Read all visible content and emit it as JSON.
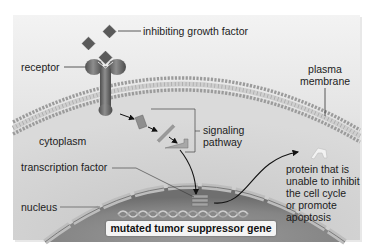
{
  "diagram": {
    "title": "",
    "colors": {
      "background": "#ffffff",
      "panel_light": "#ececec",
      "panel_dark": "#bdbdbd",
      "membrane_head": "#8a8a8a",
      "receptor": "#6e6e6e",
      "growth_factor": "#555555",
      "nucleus_interior": "#8c8c8c",
      "text": "#1c1c1c",
      "arrow": "#111111"
    },
    "labels": {
      "inhibiting_growth_factor": "inhibiting growth factor",
      "receptor": "receptor",
      "plasma_membrane_line1": "plasma",
      "plasma_membrane_line2": "membrane",
      "cytoplasm": "cytoplasm",
      "signaling_pathway_line1": "signaling",
      "signaling_pathway_line2": "pathway",
      "transcription_factor": "transcription factor",
      "nucleus": "nucleus",
      "mutated_gene": "mutated tumor suppressor gene",
      "protein_line1": "protein that is",
      "protein_line2": "unable to inhibit",
      "protein_line3": "the cell cycle",
      "protein_line4": "or promote",
      "protein_line5": "apoptosis"
    },
    "icons": {
      "growth_factor": "diamond-molecule",
      "receptor": "y-shaped-receptor",
      "signaling_molecules": "rectangular-proteins",
      "transcription_factor": "stacked-bars",
      "dna": "double-helix",
      "output_protein": "chevron-protein"
    }
  }
}
